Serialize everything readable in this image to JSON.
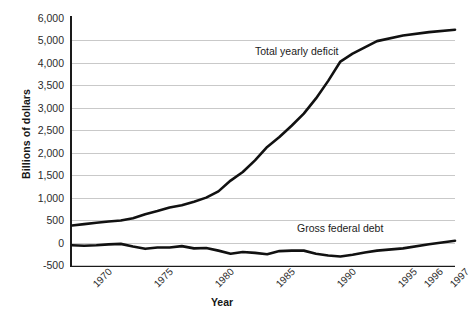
{
  "chart_data": {
    "type": "line",
    "title": "",
    "xlabel": "Year",
    "ylabel": "Billions of dollars",
    "grid": true,
    "legend_position": "inline-annotation",
    "x_tick_labels": [
      "1970",
      "1975",
      "1980",
      "1985",
      "1990",
      "1995",
      "1996",
      "1997",
      "1998"
    ],
    "y_tick_labels": [
      "6,000",
      "5,000",
      "4,000",
      "3,500",
      "3,000",
      "2,500",
      "2,000",
      "1,500",
      "1,000",
      "500",
      "0",
      "-500"
    ],
    "y_tick_values": [
      6000,
      5000,
      4000,
      3500,
      3000,
      2500,
      2000,
      1500,
      1000,
      500,
      0,
      -500
    ],
    "x": [
      1970,
      1971,
      1972,
      1973,
      1974,
      1975,
      1976,
      1977,
      1978,
      1979,
      1980,
      1981,
      1982,
      1983,
      1984,
      1985,
      1986,
      1987,
      1988,
      1989,
      1990,
      1991,
      1992,
      1993,
      1994,
      1995,
      1996,
      1997,
      1998
    ],
    "series": [
      {
        "name": "Total yearly deficit",
        "label_text": "Total yearly deficit",
        "color": "#111111",
        "values": [
          380,
          410,
          440,
          470,
          490,
          540,
          630,
          700,
          780,
          830,
          910,
          1000,
          1140,
          1380,
          1570,
          1830,
          2130,
          2350,
          2600,
          2870,
          3210,
          3600,
          4060,
          4410,
          4690,
          4970,
          5220,
          5370,
          5480
        ]
      },
      {
        "name": "Gross federal debt",
        "label_text": "Gross federal debt",
        "color": "#111111",
        "values": [
          -60,
          -70,
          -60,
          -40,
          -30,
          -90,
          -140,
          -110,
          -110,
          -80,
          -130,
          -120,
          -180,
          -250,
          -210,
          -230,
          -260,
          -190,
          -180,
          -180,
          -250,
          -290,
          -310,
          -270,
          -220,
          -180,
          -130,
          -40,
          40
        ]
      }
    ],
    "annotations": [
      {
        "text": "Total yearly deficit",
        "near_x": 1989,
        "near_y": 4300
      },
      {
        "text": "Gross federal debt",
        "near_x": 1992,
        "near_y": 480
      }
    ]
  },
  "axis": {
    "y_title": "Billions of dollars",
    "x_title": "Year"
  }
}
